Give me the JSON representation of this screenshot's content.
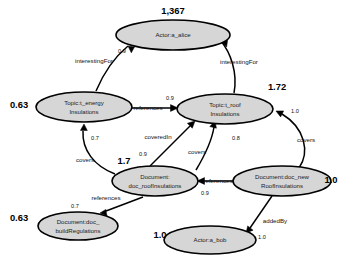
{
  "diagram": {
    "background_color": "#ffffff",
    "node_fill_color": "#d6d6d6",
    "node_stroke_color": "#000000",
    "edge_color": "#000000"
  },
  "nodes": [
    {
      "id": "a_alice",
      "type": "Actor",
      "label_line1": "Actor:a_alice",
      "label_line2": "",
      "score": "1,367",
      "cx": 173,
      "cy": 35,
      "rx": 57,
      "ry": 15,
      "score_x": 173,
      "score_y": 12
    },
    {
      "id": "t_energy",
      "type": "Topic",
      "label_line1": "Topic:t_energy",
      "label_line2": "Insulations",
      "score": "0.63",
      "cx": 84,
      "cy": 107,
      "rx": 48,
      "ry": 15,
      "score_x": 19,
      "score_y": 106
    },
    {
      "id": "t_roof",
      "type": "Topic",
      "label_line1": "Topic:t_roof",
      "label_line2": "Insulations",
      "score": "1.72",
      "cx": 225,
      "cy": 109,
      "rx": 48,
      "ry": 15,
      "score_x": 277,
      "score_y": 88
    },
    {
      "id": "doc_roofInsulations",
      "type": "Document",
      "label_line1": "Document:",
      "label_line2": "doc_roofInsulations",
      "score": "1.7",
      "cx": 155,
      "cy": 181,
      "rx": 43,
      "ry": 15,
      "score_x": 124,
      "score_y": 162
    },
    {
      "id": "doc_newRoofInsulations",
      "type": "Document",
      "label_line1": "Document:doc_new",
      "label_line2": "RoofInsulations",
      "score": "1.0",
      "cx": 282,
      "cy": 181,
      "rx": 49,
      "ry": 15,
      "score_x": 331,
      "score_y": 181
    },
    {
      "id": "doc_buildRegulations",
      "type": "Document",
      "label_line1": "Document:doc_",
      "label_line2": "buildRegulations",
      "score": "0.63",
      "cx": 78,
      "cy": 226,
      "rx": 40,
      "ry": 14,
      "score_x": 19,
      "score_y": 219
    },
    {
      "id": "a_bob",
      "type": "Actor",
      "label_line1": "Actor:a_bob",
      "label_line2": "",
      "score": "1.0",
      "cx": 210,
      "cy": 240,
      "rx": 46,
      "ry": 14,
      "score_x": 160,
      "score_y": 236
    }
  ],
  "edges": [
    {
      "id": "energy-interestingFor-alice",
      "source": "t_energy",
      "target": "a_alice",
      "label": "interestingFor",
      "weight": "0.9",
      "path": "M 96 91 C 104 72 116 56 128 46",
      "arrow": "M 128 46 l 6.5 1.0 l -3.2 5.8 z",
      "label_x": 94,
      "label_y": 61,
      "weight_x": 122,
      "weight_y": 52
    },
    {
      "id": "roof-interestingFor-alice",
      "source": "t_roof",
      "target": "a_alice",
      "label": "interestingFor",
      "weight": "0.8",
      "path": "M 234 93 C 238 72 230 52 221 41",
      "arrow": "M 221 41 l 6.6 -0.6 l -1.0 6.5 z",
      "label_x": 239,
      "label_y": 62,
      "weight_x": 212,
      "weight_y": 35
    },
    {
      "id": "energy-references-roof",
      "source": "t_energy",
      "target": "t_roof",
      "label": "references",
      "weight": "0.9",
      "path": "M 132 108 L 172 108",
      "arrow": "M 178 108 l -7.5 -3.4 l 0 6.8 z",
      "label_x": 148,
      "label_y": 108,
      "weight_x": 170,
      "weight_y": 99
    },
    {
      "id": "docroof-coveredIn-roof",
      "source": "doc_roofInsulations",
      "target": "t_roof",
      "label": "coveredIn",
      "weight": "0.9",
      "path": "M 150 166 L 190 126",
      "arrow": "M 195 121 l -7.6 2.3 l 4.9 4.9 z",
      "label_x": 158,
      "label_y": 137,
      "weight_x": 143,
      "weight_y": 155
    },
    {
      "id": "docnew-covers-roof",
      "source": "doc_newRoofInsulations",
      "target": "t_roof",
      "label": "covers",
      "weight": "0.8",
      "path": "M 196 170 C 205 155 212 140 214 127",
      "arrow": "M 215 121 l -5.2 5.6 l 6.6 1.6 z",
      "label_x": 197,
      "label_y": 152,
      "weight_x": 236,
      "weight_y": 139
    },
    {
      "id": "docnew-covers2-roof",
      "source": "doc_newRoofInsulations",
      "target": "t_roof",
      "label": "covers",
      "weight": "1.0",
      "path": "M 299 168 C 310 152 305 128 282 114",
      "arrow": "M 276 111 l 4.6 5.9 l 3.0 -6.0 z",
      "label_x": 306,
      "label_y": 140,
      "weight_x": 295,
      "weight_y": 112
    },
    {
      "id": "docroof-covers-energy",
      "source": "doc_roofInsulations",
      "target": "t_energy",
      "label": "covers",
      "weight": "0.7",
      "path": "M 115 174 C 94 166 82 150 83 131",
      "arrow": "M 84 124 l -3.6 6.4 l 6.9 0.1 z",
      "label_x": 85,
      "label_y": 160,
      "weight_x": 95,
      "weight_y": 139
    },
    {
      "id": "docnew-references-docroof",
      "source": "doc_newRoofInsulations",
      "target": "doc_roofInsulations",
      "label": "references",
      "weight": "0.9",
      "path": "M 233 181 L 203 181",
      "arrow": "M 197 181 l 7.5 -3.4 l 0 6.8 z",
      "label_x": 218,
      "label_y": 181,
      "weight_x": 205,
      "weight_y": 194
    },
    {
      "id": "docroof-references-docbuild",
      "source": "doc_roofInsulations",
      "target": "doc_buildRegulations",
      "label": "references",
      "weight": "0.7",
      "path": "M 143 197 L 106 211",
      "arrow": "M 100 213 l 7.0 3.0 l -1.2 -6.6 z",
      "label_x": 106,
      "label_y": 198,
      "weight_x": 75,
      "weight_y": 207
    },
    {
      "id": "docnew-addedBy-bob",
      "source": "doc_newRoofInsulations",
      "target": "a_bob",
      "label": "addedBy",
      "weight": "1.0",
      "path": "M 272 196 L 250 228",
      "arrow": "M 246 233 l 7.1 -2.8 l -5.4 -4.3 z",
      "label_x": 275,
      "label_y": 221,
      "weight_x": 262,
      "weight_y": 238
    }
  ]
}
